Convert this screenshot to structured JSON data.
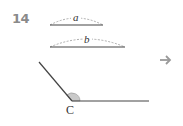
{
  "problem": {
    "number": "14"
  },
  "segments": [
    {
      "label": "a",
      "x1": 50,
      "x2": 103,
      "y": 25
    },
    {
      "label": "b",
      "x1": 50,
      "x2": 125,
      "y": 47
    }
  ],
  "angle": {
    "vertex_label": "C",
    "vertex": [
      72,
      101
    ],
    "ray1_end": [
      39,
      62
    ],
    "ray2_end": [
      149,
      101
    ],
    "marker_fill": "#c9c9c9"
  },
  "next_arrow": {
    "icon": "right-arrow-icon",
    "color": "#9a9a9a"
  },
  "colors": {
    "line": "#444444",
    "dash": "#999999",
    "number": "#8a8a8a"
  }
}
